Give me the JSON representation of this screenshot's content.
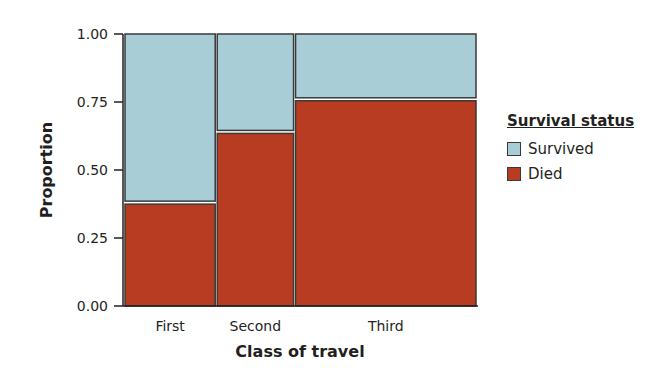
{
  "chart_data": {
    "type": "mosaic",
    "title": "",
    "xlabel": "Class of travel",
    "ylabel": "Proportion",
    "ylim": [
      0,
      1
    ],
    "yticks": [
      "0.00",
      "0.25",
      "0.50",
      "0.75",
      "1.00"
    ],
    "categories": [
      "First",
      "Second",
      "Third"
    ],
    "relative_widths": [
      0.26,
      0.22,
      0.52
    ],
    "series": [
      {
        "name": "Died",
        "color": "#b83c22",
        "values": [
          0.38,
          0.64,
          0.76
        ]
      },
      {
        "name": "Survived",
        "color": "#a8cdd7",
        "values": [
          0.62,
          0.36,
          0.24
        ]
      }
    ],
    "legend": {
      "title": "Survival status",
      "position": "right",
      "entries": [
        "Survived",
        "Died"
      ]
    },
    "grid": false
  },
  "colors": {
    "survived": "#a8cdd7",
    "died": "#b83c22",
    "outline": "#3a3a3a",
    "axis": "#231f20"
  }
}
